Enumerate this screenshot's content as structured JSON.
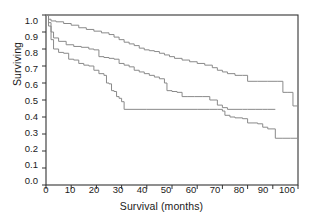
{
  "chart_data": {
    "type": "line",
    "title": "",
    "xlabel": "Survival (months)",
    "ylabel": "Surviving",
    "xlim": [
      0,
      100
    ],
    "ylim": [
      0,
      1.0
    ],
    "xticks": [
      "0",
      "10",
      "20",
      "30",
      "40",
      "50",
      "60",
      "70",
      "80",
      "90",
      "100"
    ],
    "yticks": [
      "0.0",
      "0.1",
      "0.2",
      "0.3",
      "0.4",
      "0.5",
      "0.6",
      "0.7",
      "0.8",
      "0.9",
      "1.0"
    ],
    "grid": false,
    "legend": "none",
    "step_style": "post",
    "line_color": "#8a8a8a",
    "frame_color": "#333333",
    "series": [
      {
        "name": "Upper curve",
        "x": [
          0,
          1,
          2,
          4,
          7,
          10,
          13,
          16,
          19,
          22,
          25,
          27,
          29,
          31,
          33,
          35,
          37,
          39,
          41,
          43,
          45,
          47,
          49,
          51,
          54,
          57,
          60,
          63,
          66,
          68,
          70,
          72,
          75,
          78,
          80,
          84,
          88,
          92,
          94,
          96,
          98,
          100
        ],
        "y": [
          1.0,
          0.975,
          0.965,
          0.96,
          0.95,
          0.94,
          0.925,
          0.915,
          0.905,
          0.895,
          0.885,
          0.87,
          0.855,
          0.84,
          0.83,
          0.82,
          0.805,
          0.795,
          0.79,
          0.785,
          0.775,
          0.765,
          0.755,
          0.745,
          0.735,
          0.725,
          0.715,
          0.705,
          0.69,
          0.675,
          0.665,
          0.655,
          0.645,
          0.645,
          0.61,
          0.61,
          0.61,
          0.61,
          0.545,
          0.545,
          0.465,
          0.465
        ]
      },
      {
        "name": "Middle curve",
        "x": [
          0,
          1,
          2,
          3,
          5,
          8,
          11,
          14,
          17,
          19,
          21,
          23,
          25,
          27,
          29,
          31,
          33,
          35,
          37,
          39,
          41,
          43,
          45,
          47,
          48,
          50,
          52,
          54,
          56,
          59,
          62,
          65,
          68,
          70,
          72,
          75,
          78,
          80,
          83,
          86,
          88,
          91
        ],
        "y": [
          1.0,
          0.955,
          0.9,
          0.865,
          0.845,
          0.825,
          0.815,
          0.81,
          0.8,
          0.795,
          0.755,
          0.75,
          0.745,
          0.74,
          0.715,
          0.705,
          0.695,
          0.675,
          0.665,
          0.655,
          0.645,
          0.635,
          0.625,
          0.6,
          0.555,
          0.55,
          0.545,
          0.52,
          0.52,
          0.52,
          0.52,
          0.5,
          0.47,
          0.455,
          0.445,
          0.445,
          0.445,
          0.445,
          0.445,
          0.445,
          0.445,
          0.445
        ]
      },
      {
        "name": "Lower curve",
        "x": [
          0,
          1,
          2,
          3,
          5,
          7,
          9,
          11,
          13,
          15,
          17,
          19,
          21,
          23,
          24,
          25,
          26,
          27,
          28,
          29,
          30,
          31,
          40,
          50,
          60,
          65,
          68,
          70,
          71,
          73,
          75,
          78,
          80,
          84,
          86,
          88,
          91,
          94,
          97,
          100
        ],
        "y": [
          1.0,
          0.935,
          0.855,
          0.8,
          0.78,
          0.775,
          0.74,
          0.735,
          0.715,
          0.705,
          0.7,
          0.675,
          0.655,
          0.645,
          0.6,
          0.595,
          0.555,
          0.55,
          0.52,
          0.51,
          0.49,
          0.445,
          0.445,
          0.445,
          0.445,
          0.445,
          0.445,
          0.435,
          0.41,
          0.4,
          0.395,
          0.39,
          0.365,
          0.36,
          0.34,
          0.33,
          0.275,
          0.275,
          0.275,
          0.275
        ]
      }
    ]
  }
}
